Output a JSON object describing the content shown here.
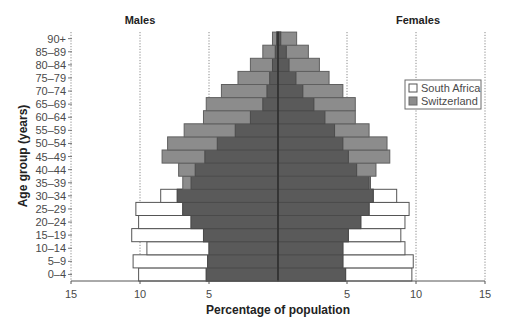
{
  "chart_data": {
    "type": "bar",
    "subtype": "population-pyramid",
    "title": "",
    "xlabel": "Percentage of population",
    "ylabel": "Age group (years)",
    "left_title": "Males",
    "right_title": "Females",
    "xlim": [
      -15,
      15
    ],
    "x_ticks": [
      {
        "value": -15,
        "label": "15"
      },
      {
        "value": -10,
        "label": "10"
      },
      {
        "value": -5,
        "label": "5"
      },
      {
        "value": 5,
        "label": "5"
      },
      {
        "value": 10,
        "label": "10"
      },
      {
        "value": 15,
        "label": "15"
      }
    ],
    "grid": {
      "vertical_dotted_at": [
        -15,
        -10,
        -5,
        5,
        10,
        15
      ]
    },
    "legend": {
      "position": "right-upper",
      "entries": [
        {
          "name": "South Africa",
          "color": "#ffffff"
        },
        {
          "name": "Switzerland",
          "color": "#8c8c8c"
        }
      ]
    },
    "categories": [
      "0–4",
      "5–9",
      "10–14",
      "15–19",
      "20–24",
      "25–29",
      "30–34",
      "35–39",
      "40–44",
      "45–49",
      "50–54",
      "55–59",
      "60–64",
      "65–69",
      "70–74",
      "75–79",
      "80–84",
      "85–89",
      "90+"
    ],
    "series": [
      {
        "name": "South Africa",
        "males": [
          10.1,
          10.5,
          9.5,
          10.6,
          10.1,
          10.3,
          8.5,
          6.3,
          6.0,
          5.3,
          4.4,
          3.1,
          2.0,
          1.1,
          0.8,
          0.6,
          0.4,
          0.2,
          0.1
        ],
        "females": [
          9.7,
          9.8,
          9.2,
          8.9,
          9.2,
          9.5,
          8.6,
          6.7,
          5.7,
          5.1,
          4.7,
          4.1,
          3.4,
          2.6,
          1.8,
          1.3,
          0.8,
          0.6,
          0.2
        ]
      },
      {
        "name": "Switzerland",
        "males": [
          5.2,
          5.1,
          5.0,
          5.4,
          6.3,
          6.9,
          7.3,
          6.9,
          7.2,
          8.4,
          8.0,
          6.8,
          5.4,
          5.2,
          4.1,
          2.9,
          2.0,
          1.1,
          0.4
        ],
        "females": [
          4.9,
          4.7,
          4.7,
          5.1,
          6.0,
          6.6,
          6.9,
          6.6,
          7.1,
          8.1,
          7.9,
          6.6,
          5.6,
          5.6,
          4.7,
          3.7,
          3.0,
          2.2,
          1.35
        ]
      }
    ]
  }
}
